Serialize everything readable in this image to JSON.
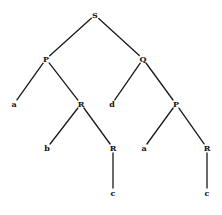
{
  "diagram": {
    "type": "tree",
    "nodes": [
      {
        "id": "n0",
        "label": "S",
        "x": 95,
        "y": 15
      },
      {
        "id": "n1",
        "label": "P",
        "x": 46,
        "y": 59
      },
      {
        "id": "n2",
        "label": "Q",
        "x": 143,
        "y": 59
      },
      {
        "id": "n3",
        "label": "a",
        "x": 14,
        "y": 104
      },
      {
        "id": "n4",
        "label": "R",
        "x": 81,
        "y": 104
      },
      {
        "id": "n5",
        "label": "d",
        "x": 112,
        "y": 104
      },
      {
        "id": "n6",
        "label": "P",
        "x": 176,
        "y": 104
      },
      {
        "id": "n7",
        "label": "b",
        "x": 47,
        "y": 148
      },
      {
        "id": "n8",
        "label": "R",
        "x": 113,
        "y": 148
      },
      {
        "id": "n9",
        "label": "a",
        "x": 144,
        "y": 148
      },
      {
        "id": "n10",
        "label": "R",
        "x": 207,
        "y": 148
      },
      {
        "id": "n11",
        "label": "c",
        "x": 113,
        "y": 193
      },
      {
        "id": "n12",
        "label": "c",
        "x": 207,
        "y": 193
      }
    ],
    "edges": [
      {
        "from": "n0",
        "to": "n1"
      },
      {
        "from": "n0",
        "to": "n2"
      },
      {
        "from": "n1",
        "to": "n3"
      },
      {
        "from": "n1",
        "to": "n4"
      },
      {
        "from": "n2",
        "to": "n5"
      },
      {
        "from": "n2",
        "to": "n6"
      },
      {
        "from": "n4",
        "to": "n7"
      },
      {
        "from": "n4",
        "to": "n8"
      },
      {
        "from": "n6",
        "to": "n9"
      },
      {
        "from": "n6",
        "to": "n10"
      },
      {
        "from": "n8",
        "to": "n11"
      },
      {
        "from": "n10",
        "to": "n12"
      }
    ]
  }
}
